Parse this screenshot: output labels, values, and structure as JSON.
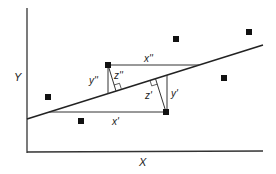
{
  "diagram": {
    "axes": {
      "x_label": "X",
      "y_label": "Y"
    },
    "regression_line": {
      "from": [
        27,
        119
      ],
      "to": [
        263,
        45
      ]
    },
    "points": [
      {
        "x": 48,
        "y": 97
      },
      {
        "x": 81,
        "y": 121
      },
      {
        "x": 108,
        "y": 65
      },
      {
        "x": 166,
        "y": 112
      },
      {
        "x": 176,
        "y": 39
      },
      {
        "x": 224,
        "y": 78
      },
      {
        "x": 249,
        "y": 32
      }
    ],
    "labels": {
      "x_double_prime": "x''",
      "y_double_prime": "y''",
      "z_double_prime": "z''",
      "x_prime": "x'",
      "y_prime": "y'",
      "z_prime": "z'"
    }
  }
}
